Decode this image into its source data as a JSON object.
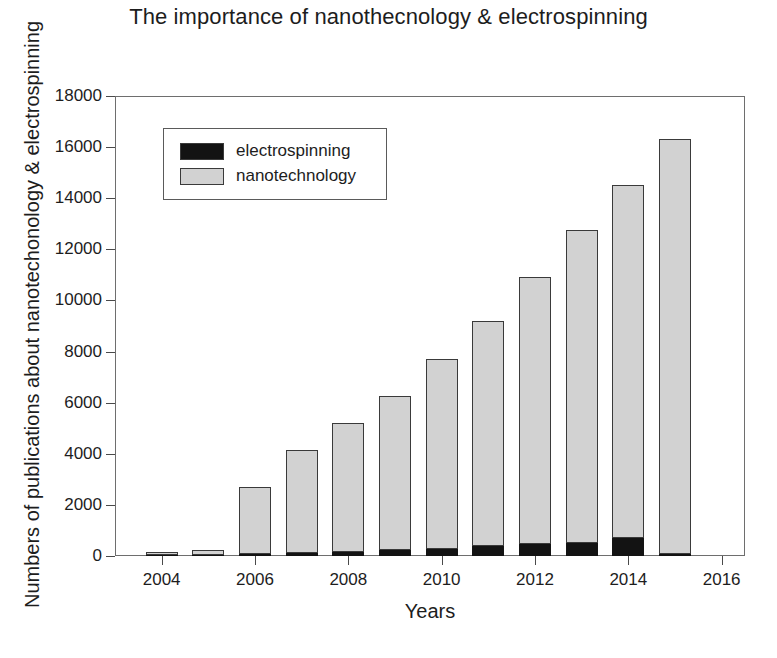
{
  "chart_data": {
    "type": "bar",
    "subtype": "stacked",
    "title": "The importance of nanothecnology & electrospinning",
    "xlabel": "Years",
    "ylabel": "Numbers of publications about nanotechonology & electrospinning",
    "categories": [
      2004,
      2005,
      2006,
      2007,
      2008,
      2009,
      2010,
      2011,
      2012,
      2013,
      2014,
      2015
    ],
    "series": [
      {
        "name": "electrospinning",
        "color": "#131313",
        "values": [
          20,
          40,
          80,
          110,
          160,
          220,
          260,
          380,
          480,
          520,
          700,
          60
        ]
      },
      {
        "name": "nanotechnology",
        "color": "#d2d2d2",
        "values": [
          80,
          160,
          2620,
          4040,
          5040,
          6030,
          7440,
          8820,
          10420,
          12230,
          13800,
          16240
        ]
      }
    ],
    "totals": [
      100,
      200,
      2700,
      4150,
      5200,
      6250,
      7700,
      9200,
      10900,
      12750,
      14500,
      16300
    ],
    "ylim": [
      0,
      18000
    ],
    "yticks": [
      0,
      2000,
      4000,
      6000,
      8000,
      10000,
      12000,
      14000,
      16000,
      18000
    ],
    "ytick_labels": [
      "0",
      "2000",
      "4000",
      "6000",
      "8000",
      "10000",
      "12000",
      "14000",
      "16000",
      "18000"
    ],
    "xlim": [
      2003,
      2016.5
    ],
    "xticks": [
      2004,
      2006,
      2008,
      2010,
      2012,
      2014,
      2016
    ],
    "xtick_labels": [
      "2004",
      "2006",
      "2008",
      "2010",
      "2012",
      "2014",
      "2016"
    ],
    "grid": false,
    "legend": {
      "position": "upper-left-inside",
      "entries": [
        {
          "label": "electrospinning",
          "color": "#131313"
        },
        {
          "label": "nanotechnology",
          "color": "#d2d2d2"
        }
      ]
    }
  }
}
